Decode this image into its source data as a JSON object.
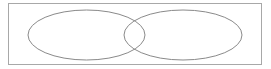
{
  "diagram": {
    "type": "venn",
    "frame": {
      "x": 8.5,
      "y": 3.5,
      "width": 253,
      "height": 61,
      "stroke": "#a8a8a8"
    },
    "sets": [
      {
        "name": "set-a",
        "cx": 86.5,
        "cy": 35,
        "rx": 58.5,
        "ry": 25,
        "stroke": "#8a8a8a"
      },
      {
        "name": "set-b",
        "cx": 183,
        "cy": 35,
        "rx": 59,
        "ry": 25,
        "stroke": "#8a8a8a"
      }
    ]
  }
}
